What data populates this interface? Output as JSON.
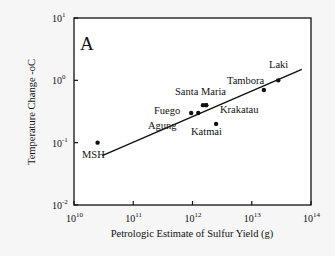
{
  "chart_data": {
    "type": "scatter",
    "panel_label": "A",
    "title": "",
    "xlabel": "Petrologic Estimate of Sulfur Yield (g)",
    "ylabel": "Temperature Change -oC",
    "xscale": "log",
    "yscale": "log",
    "xlim": [
      10000000000.0,
      100000000000000.0
    ],
    "ylim": [
      0.01,
      10
    ],
    "x_ticks": [
      {
        "base": "10",
        "exp": "10"
      },
      {
        "base": "10",
        "exp": "11"
      },
      {
        "base": "10",
        "exp": "12"
      },
      {
        "base": "10",
        "exp": "13"
      },
      {
        "base": "10",
        "exp": "14"
      }
    ],
    "y_ticks": [
      {
        "base": "10",
        "exp": "-2"
      },
      {
        "base": "10",
        "exp": "-1"
      },
      {
        "base": "10",
        "exp": "0"
      },
      {
        "base": "10",
        "exp": "1"
      }
    ],
    "grid": false,
    "legend": null,
    "points": [
      {
        "label": "MSH",
        "x": 25000000000.0,
        "y": 0.1
      },
      {
        "label": "Fuego",
        "x": 950000000000.0,
        "y": 0.3
      },
      {
        "label": "Agung",
        "x": 1250000000000.0,
        "y": 0.3
      },
      {
        "label": "Santa Maria",
        "x": 1500000000000.0,
        "y": 0.4
      },
      {
        "label": "Santa Maria",
        "x": 1700000000000.0,
        "y": 0.4
      },
      {
        "label": "Katmai",
        "x": 2500000000000.0,
        "y": 0.2
      },
      {
        "label": "Krakatau",
        "x": 1700000000000.0,
        "y": 0.4
      },
      {
        "label": "Tambora",
        "x": 16000000000000.0,
        "y": 0.7
      },
      {
        "label": "Laki",
        "x": 28000000000000.0,
        "y": 1.0
      }
    ],
    "labels": [
      {
        "text": "MSH",
        "x": 82,
        "y": 158
      },
      {
        "text": "Agung",
        "x": 148,
        "y": 129
      },
      {
        "text": "Fuego",
        "x": 154,
        "y": 114
      },
      {
        "text": "Santa Maria",
        "x": 175,
        "y": 95
      },
      {
        "text": "Katmai",
        "x": 191,
        "y": 135
      },
      {
        "text": "Krakatau",
        "x": 220,
        "y": 113
      },
      {
        "text": "Tambora",
        "x": 227,
        "y": 84
      },
      {
        "text": "Laki",
        "x": 269,
        "y": 68
      }
    ],
    "fit_line": {
      "x": [
        30000000000.0,
        70000000000000.0
      ],
      "y": [
        0.062,
        1.5
      ]
    }
  }
}
